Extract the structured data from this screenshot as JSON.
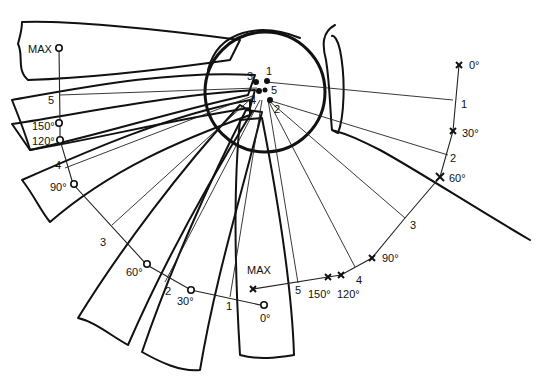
{
  "figure": {
    "colors": {
      "ink": "#111111",
      "background": "#ffffff"
    }
  },
  "center_points": {
    "labels": [
      "1",
      "2",
      "3",
      "4",
      "5"
    ]
  },
  "left_track": {
    "marker": "circle",
    "labels": {
      "max": "MAX",
      "p150": "150°",
      "p120": "120°",
      "p90": "90°",
      "p60": "60°",
      "p30": "30°",
      "p0": "0°"
    },
    "segment_numbers": [
      "1",
      "2",
      "3",
      "4",
      "5"
    ]
  },
  "right_track": {
    "marker": "cross",
    "labels": {
      "p0": "0°",
      "p30": "30°",
      "p60": "60°",
      "p90": "90°",
      "p120": "120°",
      "p150": "150°",
      "max": "MAX"
    },
    "segment_numbers": [
      "1",
      "2",
      "3",
      "4",
      "5"
    ]
  }
}
